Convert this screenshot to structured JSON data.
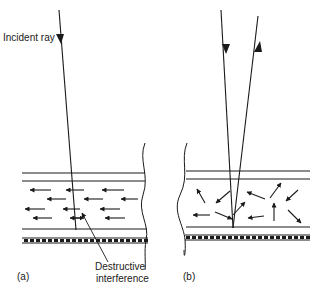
{
  "figure": {
    "colors": {
      "ink": "#1a1a1a",
      "background": "#ffffff"
    },
    "panel_a": {
      "label": "(a)",
      "incident_ray_label": "Incident ray",
      "annotation_line1": "Destructive",
      "annotation_line2": "interference",
      "description": "Incident ray enters layer; scattered arrows all point left (aligned)"
    },
    "panel_b": {
      "label": "(b)",
      "description": "Incident and reflected rays; scattered arrows point in random directions"
    }
  }
}
